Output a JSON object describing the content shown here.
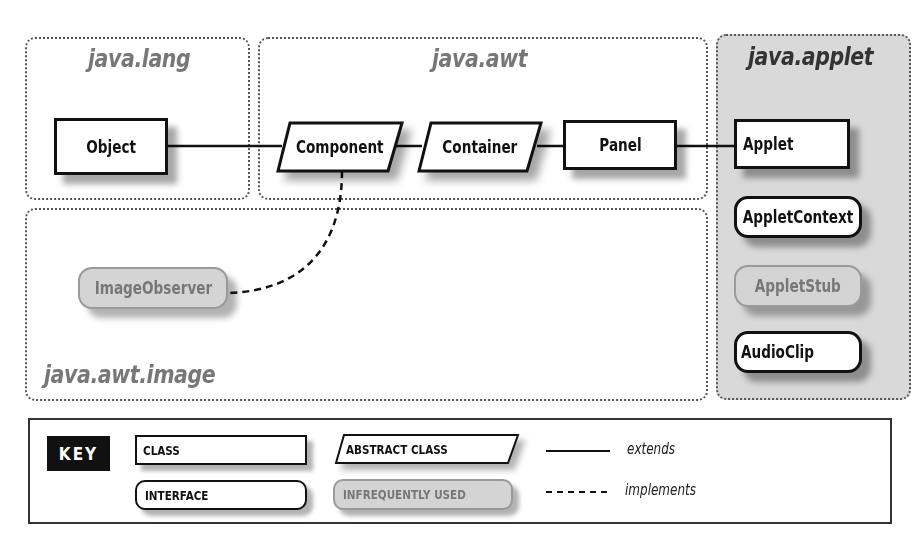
{
  "packages": {
    "java_lang": {
      "title": "java.lang"
    },
    "java_awt": {
      "title": "java.awt"
    },
    "java_applet": {
      "title": "java.applet"
    },
    "java_awt_image": {
      "title": "java.awt.image"
    }
  },
  "nodes": {
    "object": {
      "label": "Object",
      "kind": "class"
    },
    "component": {
      "label": "Component",
      "kind": "abstract-class"
    },
    "container": {
      "label": "Container",
      "kind": "abstract-class"
    },
    "panel": {
      "label": "Panel",
      "kind": "class"
    },
    "applet": {
      "label": "Applet",
      "kind": "class"
    },
    "applet_context": {
      "label": "AppletContext",
      "kind": "interface"
    },
    "applet_stub": {
      "label": "AppletStub",
      "kind": "interface-infrequently-used"
    },
    "audio_clip": {
      "label": "AudioClip",
      "kind": "interface"
    },
    "image_observer": {
      "label": "ImageObserver",
      "kind": "interface-infrequently-used"
    }
  },
  "edges": [
    {
      "from": "Component",
      "to": "Object",
      "type": "extends"
    },
    {
      "from": "Container",
      "to": "Component",
      "type": "extends"
    },
    {
      "from": "Panel",
      "to": "Container",
      "type": "extends"
    },
    {
      "from": "Applet",
      "to": "Panel",
      "type": "extends"
    },
    {
      "from": "Component",
      "to": "ImageObserver",
      "type": "implements"
    }
  ],
  "key": {
    "label": "KEY",
    "class": "CLASS",
    "abstract_class": "ABSTRACT CLASS",
    "interface": "INTERFACE",
    "infrequently_used": "INFREQUENTLY USED",
    "extends": "extends",
    "implements": "implements"
  },
  "colors": {
    "package_title": "#777777",
    "applet_package_bg": "#d9d9d9",
    "applet_title": "#333333",
    "infrequent_fill": "#d4d4d4",
    "infrequent_text": "#777777",
    "line": "#111111"
  }
}
